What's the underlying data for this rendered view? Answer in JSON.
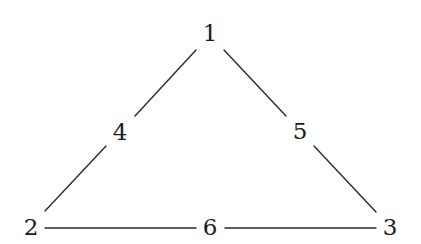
{
  "diagram": {
    "type": "triangle-graph",
    "nodes": [
      {
        "id": "n1",
        "label": "1",
        "x": 210,
        "y": 33
      },
      {
        "id": "n2",
        "label": "2",
        "x": 31,
        "y": 227
      },
      {
        "id": "n3",
        "label": "3",
        "x": 390,
        "y": 227
      },
      {
        "id": "n4",
        "label": "4",
        "x": 120,
        "y": 132
      },
      {
        "id": "n5",
        "label": "5",
        "x": 300,
        "y": 131
      },
      {
        "id": "n6",
        "label": "6",
        "x": 210,
        "y": 227
      }
    ],
    "edges": [
      {
        "from": "1",
        "to": "4"
      },
      {
        "from": "4",
        "to": "2"
      },
      {
        "from": "1",
        "to": "5"
      },
      {
        "from": "5",
        "to": "3"
      },
      {
        "from": "2",
        "to": "6"
      },
      {
        "from": "6",
        "to": "3"
      }
    ],
    "colors": {
      "line": "#2a2a2a",
      "text": "#1a1a1a",
      "background": "#ffffff"
    }
  }
}
